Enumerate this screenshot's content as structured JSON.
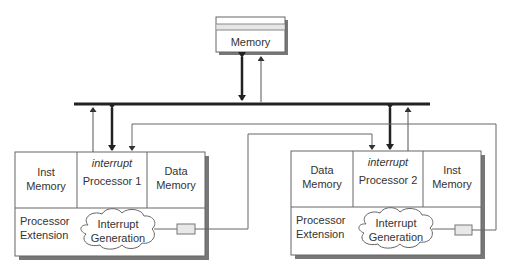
{
  "memory": {
    "label": "Memory"
  },
  "processor1": {
    "cells": {
      "inst_memory": [
        "Inst",
        "Memory"
      ],
      "processor_interrupt": "interrupt",
      "processor_label": "Processor 1",
      "data_memory": [
        "Data",
        "Memory"
      ]
    },
    "extension": [
      "Processor",
      "Extension"
    ],
    "interrupt_generation": [
      "Interrupt",
      "Generation"
    ]
  },
  "processor2": {
    "cells": {
      "data_memory": [
        "Data",
        "Memory"
      ],
      "processor_interrupt": "interrupt",
      "processor_label": "Processor 2",
      "inst_memory": [
        "Inst",
        "Memory"
      ]
    },
    "extension": [
      "Processor",
      "Extension"
    ],
    "interrupt_generation": [
      "Interrupt",
      "Generation"
    ]
  },
  "colors": {
    "line": "#555555",
    "bus": "#222222",
    "shadow": "#777777",
    "box_border": "#666666",
    "port_fill": "#e8e8e8",
    "memory_stripe": "#e6e6e6"
  }
}
